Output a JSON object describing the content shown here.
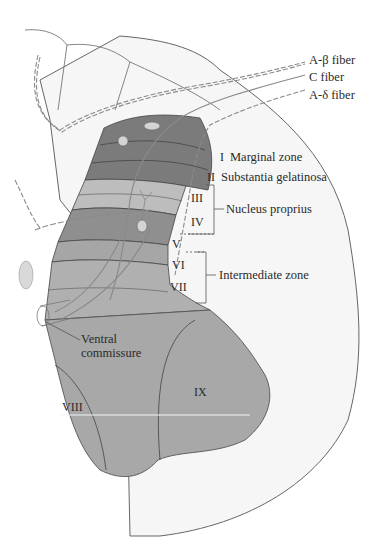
{
  "diagram": {
    "colors": {
      "background": "#ffffff",
      "white_matter": "#f4f4f4",
      "outline": "#555555",
      "lamina_dark": "#7a7a7a",
      "lamina_mid": "#9a9a9a",
      "lamina_light": "#bdbdbd",
      "ventral_gray": "#a9a9a9",
      "fiber": "#8a8a8a"
    },
    "fibers": [
      {
        "label": "A-β fiber"
      },
      {
        "label": "C fiber"
      },
      {
        "label": "A-δ fiber"
      }
    ],
    "laminae": [
      {
        "numeral": "I",
        "label": "Marginal zone"
      },
      {
        "numeral": "II",
        "label": "Substantia gelatinosa"
      },
      {
        "numeral": "III",
        "group": "Nucleus proprius"
      },
      {
        "numeral": "IV",
        "group": "Nucleus proprius"
      },
      {
        "numeral": "V"
      },
      {
        "numeral": "VI",
        "group": "Intermediate zone"
      },
      {
        "numeral": "VII",
        "group": "Intermediate zone"
      },
      {
        "numeral": "VIII"
      },
      {
        "numeral": "IX"
      }
    ],
    "groups": {
      "nucleus_proprius": "Nucleus proprius",
      "intermediate_zone": "Intermediate zone"
    },
    "other_labels": {
      "ventral_commissure_line1": "Ventral",
      "ventral_commissure_line2": "commissure"
    }
  }
}
